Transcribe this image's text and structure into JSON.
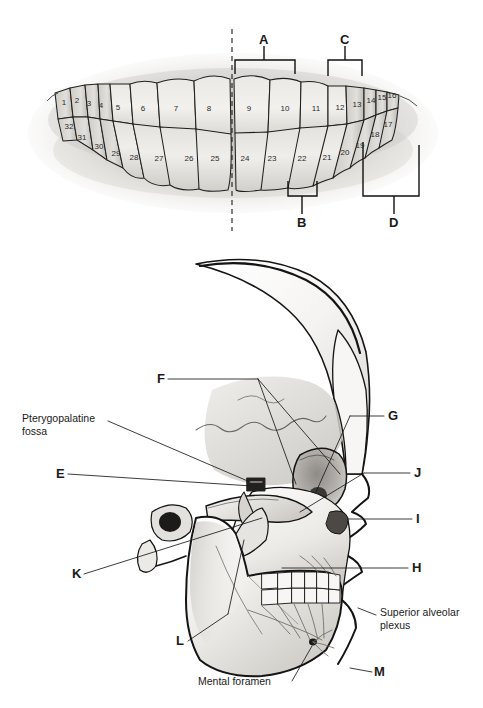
{
  "figure": {
    "panels": [
      "teeth-numbering-panel",
      "lateral-skull-panel"
    ]
  },
  "teeth_panel": {
    "midline_label": "dashed-midline",
    "upper_arch_numbers": [
      {
        "n": "1",
        "x": 64,
        "y": 102
      },
      {
        "n": "2",
        "x": 77,
        "y": 100
      },
      {
        "n": "3",
        "x": 89,
        "y": 103
      },
      {
        "n": "4",
        "x": 101,
        "y": 105
      },
      {
        "n": "5",
        "x": 118,
        "y": 107
      },
      {
        "n": "6",
        "x": 143,
        "y": 108
      },
      {
        "n": "7",
        "x": 176,
        "y": 108
      },
      {
        "n": "8",
        "x": 209,
        "y": 108
      },
      {
        "n": "9",
        "x": 249,
        "y": 108
      },
      {
        "n": "10",
        "x": 285,
        "y": 108
      },
      {
        "n": "11",
        "x": 316,
        "y": 108
      },
      {
        "n": "12",
        "x": 340,
        "y": 107
      },
      {
        "n": "13",
        "x": 357,
        "y": 104
      },
      {
        "n": "14",
        "x": 371,
        "y": 100
      },
      {
        "n": "15",
        "x": 382,
        "y": 97
      },
      {
        "n": "16",
        "x": 392,
        "y": 95
      }
    ],
    "lower_arch_numbers": [
      {
        "n": "32",
        "x": 69,
        "y": 126
      },
      {
        "n": "31",
        "x": 82,
        "y": 137
      },
      {
        "n": "30",
        "x": 99,
        "y": 146
      },
      {
        "n": "29",
        "x": 116,
        "y": 153
      },
      {
        "n": "28",
        "x": 134,
        "y": 157
      },
      {
        "n": "27",
        "x": 159,
        "y": 158
      },
      {
        "n": "26",
        "x": 189,
        "y": 158
      },
      {
        "n": "25",
        "x": 215,
        "y": 158
      },
      {
        "n": "24",
        "x": 245,
        "y": 158
      },
      {
        "n": "23",
        "x": 272,
        "y": 158
      },
      {
        "n": "22",
        "x": 302,
        "y": 158
      },
      {
        "n": "21",
        "x": 327,
        "y": 157
      },
      {
        "n": "20",
        "x": 345,
        "y": 152
      },
      {
        "n": "19",
        "x": 360,
        "y": 145
      },
      {
        "n": "18",
        "x": 375,
        "y": 134
      },
      {
        "n": "17",
        "x": 388,
        "y": 124
      }
    ],
    "brackets": [
      {
        "id": "A",
        "label": "A",
        "label_x": 264,
        "label_y": 40,
        "x1": 235,
        "x2": 295,
        "y": 60,
        "dir": "up"
      },
      {
        "id": "C",
        "label": "C",
        "label_x": 345,
        "label_y": 40,
        "x1": 328,
        "x2": 362,
        "y": 60,
        "dir": "up"
      },
      {
        "id": "B",
        "label": "B",
        "label_x": 302,
        "label_y": 228,
        "x1": 288,
        "x2": 317,
        "y": 193,
        "dir": "down"
      },
      {
        "id": "D",
        "label": "D",
        "label_x": 394,
        "label_y": 228,
        "x1": 363,
        "x2": 419,
        "y": 175,
        "dir": "down"
      }
    ]
  },
  "skull_panel": {
    "labels": [
      {
        "id": "F",
        "text": "F",
        "type": "letter",
        "x": 157,
        "y": 374,
        "anchor": "left"
      },
      {
        "id": "pterygopalatine",
        "text": "Pterygopalatine",
        "type": "text",
        "x": 22,
        "y": 418,
        "anchor": "left"
      },
      {
        "id": "pterygopalatine2",
        "text": "fossa",
        "type": "text",
        "x": 22,
        "y": 431,
        "anchor": "left"
      },
      {
        "id": "E",
        "text": "E",
        "type": "letter",
        "x": 56,
        "y": 469,
        "anchor": "left"
      },
      {
        "id": "K",
        "text": "K",
        "type": "letter",
        "x": 72,
        "y": 569,
        "anchor": "left"
      },
      {
        "id": "L",
        "text": "L",
        "type": "letter",
        "x": 176,
        "y": 638,
        "anchor": "left"
      },
      {
        "id": "mental-foramen",
        "text": "Mental foramen",
        "type": "text",
        "x": 198,
        "y": 684,
        "anchor": "left"
      },
      {
        "id": "G",
        "text": "G",
        "type": "letter",
        "x": 388,
        "y": 412,
        "anchor": "left"
      },
      {
        "id": "J",
        "text": "J",
        "type": "letter",
        "x": 414,
        "y": 470,
        "anchor": "left"
      },
      {
        "id": "I",
        "text": "I",
        "type": "letter",
        "x": 415,
        "y": 516,
        "anchor": "left"
      },
      {
        "id": "H",
        "text": "H",
        "type": "letter",
        "x": 412,
        "y": 565,
        "anchor": "left"
      },
      {
        "id": "superior-alveolar",
        "text": "Superior alveolar",
        "type": "text",
        "x": 380,
        "y": 612,
        "anchor": "left"
      },
      {
        "id": "superior-alveolar2",
        "text": "plexus",
        "type": "text",
        "x": 380,
        "y": 625,
        "anchor": "left"
      },
      {
        "id": "M",
        "text": "M",
        "type": "letter",
        "x": 374,
        "y": 669,
        "anchor": "left"
      }
    ]
  },
  "colors": {
    "ink": "#1a1a1a",
    "line": "#2b2b2b",
    "tooth_fill_light": "#f1f0ee",
    "tooth_fill_mid": "#dedcd8",
    "tooth_fill_dark": "#c6c3bd",
    "gum_shadow": "#bfbcb7",
    "bone_light": "#fafafa",
    "bone_mid": "#e6e5e3",
    "bone_dark": "#b9b7b3",
    "background": "#ffffff"
  }
}
